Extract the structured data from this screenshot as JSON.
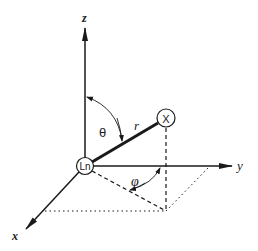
{
  "diagram": {
    "type": "spherical-coordinate-system",
    "axes": {
      "z": {
        "label": "z"
      },
      "y": {
        "label": "y"
      },
      "x": {
        "label": "x"
      }
    },
    "nodes": {
      "origin": {
        "label": "Ln"
      },
      "point": {
        "label": "X"
      }
    },
    "symbols": {
      "radius": "r",
      "polar_angle": "θ",
      "azimuth_angle": "φ"
    },
    "colors": {
      "stroke": "#1a1a1a",
      "background": "#ffffff"
    }
  }
}
